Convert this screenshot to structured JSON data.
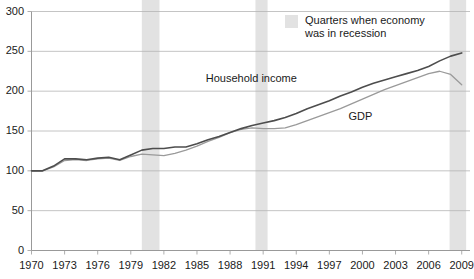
{
  "chart_data": {
    "type": "line",
    "title": "",
    "subtitle": "",
    "xlabel": "",
    "ylabel": "",
    "xlim": [
      1970,
      2009.75
    ],
    "ylim": [
      0,
      300
    ],
    "grid": true,
    "y_ticks": [
      0,
      50,
      100,
      150,
      200,
      250,
      300
    ],
    "x_ticks": [
      1970,
      1973,
      1976,
      1979,
      1982,
      1985,
      1988,
      1991,
      1994,
      1997,
      2000,
      2003,
      2006,
      2009
    ],
    "legend_position": "top-right",
    "legend": [
      {
        "label": "Quarters when economy\nwas in recession",
        "color": "#e2e2e2",
        "type": "band"
      }
    ],
    "annotations": [
      {
        "text": "Household income",
        "x": 1994.5,
        "y": 215,
        "series": "Household income"
      },
      {
        "text": "GDP",
        "x": 2000.0,
        "y": 168,
        "series": "GDP"
      }
    ],
    "shaded_regions": [
      {
        "label": "recession",
        "x_start": 1980.0,
        "x_end": 1981.6
      },
      {
        "label": "recession",
        "x_start": 1990.3,
        "x_end": 1991.4
      },
      {
        "label": "recession",
        "x_start": 2007.9,
        "x_end": 2009.4
      }
    ],
    "series": [
      {
        "name": "Household income",
        "color": "#4d4d4d",
        "x": [
          1970,
          1971,
          1972,
          1973,
          1974,
          1975,
          1976,
          1977,
          1978,
          1979,
          1980,
          1981,
          1982,
          1983,
          1984,
          1985,
          1986,
          1987,
          1988,
          1989,
          1990,
          1991,
          1992,
          1993,
          1994,
          1995,
          1996,
          1997,
          1998,
          1999,
          2000,
          2001,
          2002,
          2003,
          2004,
          2005,
          2006,
          2007,
          2008,
          2009
        ],
        "values": [
          100,
          100,
          106,
          115,
          115,
          114,
          116,
          117,
          114,
          120,
          126,
          128,
          128,
          130,
          130,
          134,
          139,
          143,
          148,
          153,
          157,
          160,
          163,
          167,
          172,
          178,
          183,
          188,
          194,
          199,
          205,
          210,
          214,
          218,
          222,
          226,
          231,
          238,
          244,
          248
        ]
      },
      {
        "name": "GDP",
        "color": "#9a9a9a",
        "x": [
          1970,
          1971,
          1972,
          1973,
          1974,
          1975,
          1976,
          1977,
          1978,
          1979,
          1980,
          1981,
          1982,
          1983,
          1984,
          1985,
          1986,
          1987,
          1988,
          1989,
          1990,
          1991,
          1992,
          1993,
          1994,
          1995,
          1996,
          1997,
          1998,
          1999,
          2000,
          2001,
          2002,
          2003,
          2004,
          2005,
          2006,
          2007,
          2008,
          2009
        ],
        "values": [
          100,
          100,
          105,
          113,
          114,
          113,
          115,
          116,
          113,
          118,
          121,
          120,
          119,
          122,
          126,
          131,
          137,
          142,
          148,
          152,
          154,
          153,
          153,
          154,
          158,
          163,
          168,
          173,
          178,
          184,
          190,
          196,
          202,
          207,
          212,
          217,
          222,
          225,
          221,
          208
        ]
      }
    ]
  },
  "legend_swatch_color": "#e2e2e2",
  "axis_color": "#999999",
  "grid_color": "#b5b5b5"
}
